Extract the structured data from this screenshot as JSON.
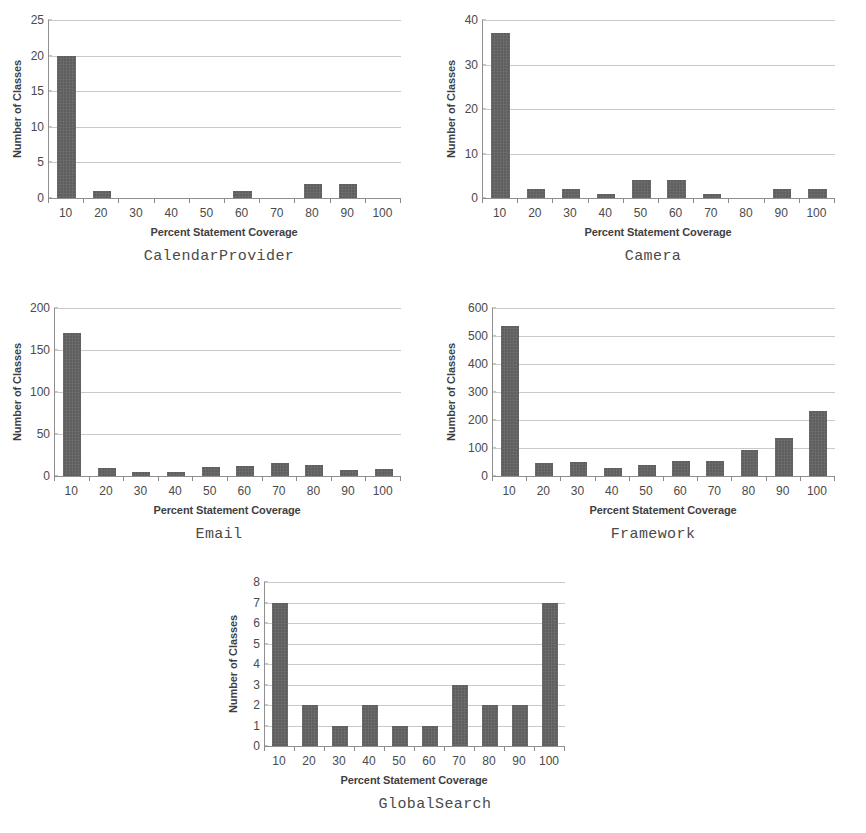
{
  "figure": {
    "axis_title_x": "Percent Statement Coverage",
    "axis_title_y": "Number of Classes",
    "bar_color": "#5f5f5f",
    "grid_color": "#c9c9c9",
    "axis_color": "#8f8f8f"
  },
  "chart_data": [
    {
      "type": "bar",
      "title": "CalendarProvider",
      "xlabel": "Percent Statement Coverage",
      "ylabel": "Number of Classes",
      "categories": [
        "10",
        "20",
        "30",
        "40",
        "50",
        "60",
        "70",
        "80",
        "90",
        "100"
      ],
      "values": [
        20,
        1,
        0,
        0,
        0,
        1,
        0,
        2,
        2,
        0
      ],
      "ylim": [
        0,
        25
      ],
      "yticks": [
        0,
        5,
        10,
        15,
        20,
        25
      ],
      "grid": true,
      "legend": "none"
    },
    {
      "type": "bar",
      "title": "Camera",
      "xlabel": "Percent Statement Coverage",
      "ylabel": "Number of Classes",
      "categories": [
        "10",
        "20",
        "30",
        "40",
        "50",
        "60",
        "70",
        "80",
        "90",
        "100"
      ],
      "values": [
        37,
        2,
        2,
        1,
        4,
        4,
        1,
        0,
        2,
        2
      ],
      "ylim": [
        0,
        40
      ],
      "yticks": [
        0,
        10,
        20,
        30,
        40
      ],
      "grid": true,
      "legend": "none"
    },
    {
      "type": "bar",
      "title": "Email",
      "xlabel": "Percent Statement Coverage",
      "ylabel": "Number of Classes",
      "categories": [
        "10",
        "20",
        "30",
        "40",
        "50",
        "60",
        "70",
        "80",
        "90",
        "100"
      ],
      "values": [
        170,
        10,
        5,
        5,
        11,
        12,
        15,
        13,
        7,
        8
      ],
      "ylim": [
        0,
        200
      ],
      "yticks": [
        0,
        50,
        100,
        150,
        200
      ],
      "grid": true,
      "legend": "none"
    },
    {
      "type": "bar",
      "title": "Framework",
      "xlabel": "Percent Statement Coverage",
      "ylabel": "Number of Classes",
      "categories": [
        "10",
        "20",
        "30",
        "40",
        "50",
        "60",
        "70",
        "80",
        "90",
        "100"
      ],
      "values": [
        535,
        45,
        50,
        30,
        40,
        55,
        55,
        93,
        137,
        232
      ],
      "ylim": [
        0,
        600
      ],
      "yticks": [
        0,
        100,
        200,
        300,
        400,
        500,
        600
      ],
      "grid": true,
      "legend": "none"
    },
    {
      "type": "bar",
      "title": "GlobalSearch",
      "xlabel": "Percent Statement Coverage",
      "ylabel": "Number of Classes",
      "categories": [
        "10",
        "20",
        "30",
        "40",
        "50",
        "60",
        "70",
        "80",
        "90",
        "100"
      ],
      "values": [
        7,
        2,
        1,
        2,
        1,
        1,
        3,
        2,
        2,
        7
      ],
      "ylim": [
        0,
        8
      ],
      "yticks": [
        0,
        1,
        2,
        3,
        4,
        5,
        6,
        7,
        8
      ],
      "grid": true,
      "legend": "none"
    }
  ]
}
